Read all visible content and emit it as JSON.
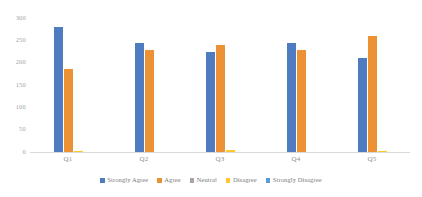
{
  "chart_data": {
    "type": "bar",
    "title": "",
    "xlabel": "",
    "ylabel": "",
    "ylim": [
      0,
      300
    ],
    "yticks": [
      0,
      50,
      100,
      150,
      200,
      250,
      300
    ],
    "ytick_labels": [
      "0",
      "50",
      "100",
      "150",
      "200",
      "250",
      "300"
    ],
    "categories": [
      "Q1",
      "Q2",
      "Q3",
      "Q4",
      "Q5"
    ],
    "grid": false,
    "legend_position": "bottom",
    "series": [
      {
        "name": "Strongly Agree",
        "color": "#4F7CC0",
        "values": [
          280,
          243,
          225,
          243,
          210
        ]
      },
      {
        "name": "Agree",
        "color": "#ED9234",
        "values": [
          185,
          228,
          240,
          228,
          260
        ]
      },
      {
        "name": "Neutral",
        "color": "#A5A5A5",
        "values": [
          0,
          0,
          0,
          0,
          0
        ]
      },
      {
        "name": "Disagree",
        "color": "#FFC72C",
        "values": [
          2,
          0,
          5,
          0,
          2
        ]
      },
      {
        "name": "Strongly Disagree",
        "color": "#5B9BD5",
        "values": [
          0,
          0,
          0,
          0,
          0
        ]
      }
    ]
  }
}
